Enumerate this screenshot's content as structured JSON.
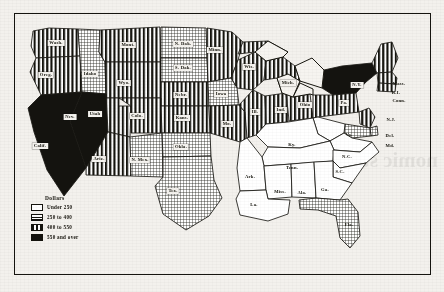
{
  "map": {
    "title": "",
    "legend": {
      "title": "Dollars",
      "items": [
        {
          "label": "Under 250",
          "class": "under",
          "pattern": "solid-white"
        },
        {
          "label": "250 to 400",
          "class": "mid",
          "pattern": "fine-crosshatch"
        },
        {
          "label": "400 to 550",
          "class": "high",
          "pattern": "vertical-bars"
        },
        {
          "label": "550 and over",
          "class": "top",
          "pattern": "solid-black"
        }
      ]
    },
    "states": [
      {
        "name": "Wash.",
        "label": "Wash.",
        "cls": "high",
        "x": 56,
        "y": 43,
        "boxed": true
      },
      {
        "name": "Oreg.",
        "label": "Oreg.",
        "cls": "high",
        "x": 46,
        "y": 75,
        "boxed": true
      },
      {
        "name": "Idaho",
        "label": "Idaho",
        "cls": "mid",
        "x": 90,
        "y": 74,
        "boxed": true
      },
      {
        "name": "Mont.",
        "label": "Mont.",
        "cls": "high",
        "x": 128,
        "y": 45,
        "boxed": true
      },
      {
        "name": "Wyo.",
        "label": "Wyo.",
        "cls": "high",
        "x": 124,
        "y": 83,
        "boxed": true
      },
      {
        "name": "N. Dak.",
        "label": "N. Dak.",
        "cls": "mid",
        "x": 183,
        "y": 44,
        "boxed": true
      },
      {
        "name": "S. Dak.",
        "label": "S. Dak.",
        "cls": "mid",
        "x": 183,
        "y": 68,
        "boxed": true
      },
      {
        "name": "Nebr.",
        "label": "Nebr.",
        "cls": "high",
        "x": 181,
        "y": 95,
        "boxed": true
      },
      {
        "name": "Nev.",
        "label": "Nev.",
        "cls": "top",
        "x": 70,
        "y": 117,
        "invert": true
      },
      {
        "name": "Calif.",
        "label": "Calif.",
        "cls": "top",
        "x": 40,
        "y": 146,
        "invert": true
      },
      {
        "name": "Utah",
        "label": "Utah",
        "cls": "high",
        "x": 95,
        "y": 114,
        "boxed": true
      },
      {
        "name": "Colo.",
        "label": "Colo.",
        "cls": "high",
        "x": 137,
        "y": 116,
        "boxed": true
      },
      {
        "name": "Kans.",
        "label": "Kans.",
        "cls": "high",
        "x": 182,
        "y": 118,
        "boxed": true
      },
      {
        "name": "Ariz.",
        "label": "Ariz.",
        "cls": "high",
        "x": 99,
        "y": 159,
        "boxed": true
      },
      {
        "name": "N. Mex.",
        "label": "N. Mex.",
        "cls": "mid",
        "x": 140,
        "y": 160,
        "boxed": true
      },
      {
        "name": "Okla.",
        "label": "Okla.",
        "cls": "mid",
        "x": 181,
        "y": 147,
        "boxed": true
      },
      {
        "name": "Tex.",
        "label": "Tex.",
        "cls": "mid",
        "x": 173,
        "y": 191,
        "boxed": true
      },
      {
        "name": "Minn.",
        "label": "Minn.",
        "cls": "high",
        "x": 215,
        "y": 50,
        "boxed": true
      },
      {
        "name": "Wis.",
        "label": "Wis.",
        "cls": "high",
        "x": 249,
        "y": 67,
        "boxed": true
      },
      {
        "name": "Iowa",
        "label": "Iowa",
        "cls": "mid",
        "x": 221,
        "y": 94,
        "boxed": true
      },
      {
        "name": "Mo.",
        "label": "Mo.",
        "cls": "high",
        "x": 227,
        "y": 124,
        "boxed": true
      },
      {
        "name": "Ark.",
        "label": "Ark.",
        "cls": "under",
        "x": 250,
        "y": 177,
        "onwhite": true
      },
      {
        "name": "La.",
        "label": "La.",
        "cls": "under",
        "x": 254,
        "y": 205,
        "onwhite": true
      },
      {
        "name": "Miss.",
        "label": "Miss.",
        "cls": "under",
        "x": 280,
        "y": 192,
        "onwhite": true
      },
      {
        "name": "Ill.",
        "label": "Ill.",
        "cls": "high",
        "x": 255,
        "y": 112,
        "boxed": true
      },
      {
        "name": "Ind.",
        "label": "Ind.",
        "cls": "high",
        "x": 281,
        "y": 110,
        "boxed": true
      },
      {
        "name": "Mich.",
        "label": "Mich.",
        "cls": "high",
        "x": 288,
        "y": 83,
        "boxed": true
      },
      {
        "name": "Ohio",
        "label": "Ohio",
        "cls": "high",
        "x": 305,
        "y": 105,
        "boxed": true
      },
      {
        "name": "Ky.",
        "label": "Ky.",
        "cls": "under",
        "x": 292,
        "y": 145,
        "onwhite": true
      },
      {
        "name": "Tenn.",
        "label": "Tenn.",
        "cls": "under",
        "x": 292,
        "y": 168,
        "onwhite": true
      },
      {
        "name": "Ala.",
        "label": "Ala.",
        "cls": "under",
        "x": 302,
        "y": 193,
        "onwhite": true
      },
      {
        "name": "Ga.",
        "label": "Ga.",
        "cls": "under",
        "x": 325,
        "y": 190,
        "onwhite": true
      },
      {
        "name": "S.C.",
        "label": "S.C.",
        "cls": "under",
        "x": 340,
        "y": 172,
        "onwhite": true
      },
      {
        "name": "N.C.",
        "label": "N.C.",
        "cls": "under",
        "x": 347,
        "y": 157,
        "onwhite": true
      },
      {
        "name": "Va.",
        "label": "Va.",
        "cls": "under",
        "x": 349,
        "y": 135,
        "onwhite": true
      },
      {
        "name": "N.Y.",
        "label": "N.Y.",
        "cls": "top",
        "x": 357,
        "y": 85,
        "invert": true
      },
      {
        "name": "Pa.",
        "label": "Pa.",
        "cls": "high",
        "x": 344,
        "y": 103,
        "boxed": true
      },
      {
        "name": "Mass.",
        "label": "Mass.",
        "cls": "high",
        "x": 399,
        "y": 84,
        "onwhite": true
      },
      {
        "name": "R.I.",
        "label": "R.I.",
        "cls": "high",
        "x": 396,
        "y": 93,
        "onwhite": true
      },
      {
        "name": "Conn.",
        "label": "Conn.",
        "cls": "high",
        "x": 399,
        "y": 101,
        "onwhite": true
      },
      {
        "name": "N.J.",
        "label": "N.J.",
        "cls": "high",
        "x": 391,
        "y": 120,
        "onwhite": true
      },
      {
        "name": "Del.",
        "label": "Del.",
        "cls": "mid",
        "x": 390,
        "y": 136,
        "onwhite": true
      },
      {
        "name": "Md.",
        "label": "Md.",
        "cls": "mid",
        "x": 390,
        "y": 146,
        "onwhite": true
      },
      {
        "name": "Fla.",
        "label": "Fla.",
        "cls": "mid",
        "x": 349,
        "y": 225,
        "onwhite": true
      }
    ]
  },
  "bleed_text": "nomic stimulus"
}
